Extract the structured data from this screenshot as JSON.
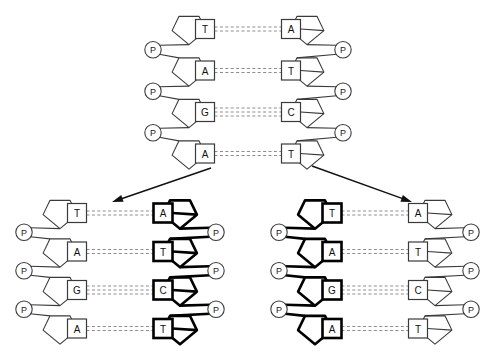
{
  "figure": {
    "background_color": "#ffffff",
    "line_color": "#3a3a3a",
    "bold_color": "#000000",
    "hbond_color": "#8d8d8d",
    "phosphate_symbol": "P"
  },
  "molecules": {
    "parent": {
      "name": "Parent DNA molecule",
      "left_strand_style": "thin",
      "right_strand_style": "thin",
      "phosphate_count_left": 3,
      "phosphate_count_right": 3,
      "rows": [
        {
          "left_base": "T",
          "right_base": "A",
          "hbonds": 2,
          "left_bold": false,
          "right_bold": false
        },
        {
          "left_base": "A",
          "right_base": "T",
          "hbonds": 2,
          "left_bold": false,
          "right_bold": false
        },
        {
          "left_base": "G",
          "right_base": "C",
          "hbonds": 3,
          "left_bold": false,
          "right_bold": false
        },
        {
          "left_base": "A",
          "right_base": "T",
          "hbonds": 2,
          "left_bold": false,
          "right_bold": false
        }
      ]
    },
    "daughter_left": {
      "name": "Daughter DNA molecule 1",
      "left_strand_style": "thin",
      "right_strand_style": "bold",
      "phosphate_count_left": 3,
      "phosphate_count_right": 3,
      "rows": [
        {
          "left_base": "T",
          "right_base": "A",
          "hbonds": 2,
          "left_bold": false,
          "right_bold": true
        },
        {
          "left_base": "A",
          "right_base": "T",
          "hbonds": 2,
          "left_bold": false,
          "right_bold": true
        },
        {
          "left_base": "G",
          "right_base": "C",
          "hbonds": 3,
          "left_bold": false,
          "right_bold": true
        },
        {
          "left_base": "A",
          "right_base": "T",
          "hbonds": 2,
          "left_bold": false,
          "right_bold": true
        }
      ]
    },
    "daughter_right": {
      "name": "Daughter DNA molecule 2",
      "left_strand_style": "bold",
      "right_strand_style": "thin",
      "phosphate_count_left": 3,
      "phosphate_count_right": 3,
      "rows": [
        {
          "left_base": "T",
          "right_base": "A",
          "hbonds": 2,
          "left_bold": true,
          "right_bold": false
        },
        {
          "left_base": "A",
          "right_base": "T",
          "hbonds": 2,
          "left_bold": true,
          "right_bold": false
        },
        {
          "left_base": "G",
          "right_base": "C",
          "hbonds": 3,
          "left_bold": true,
          "right_bold": false
        },
        {
          "left_base": "A",
          "right_base": "T",
          "hbonds": 2,
          "left_bold": true,
          "right_bold": false
        }
      ]
    }
  },
  "arrows": [
    {
      "name": "arrow-to-daughter-left",
      "x1": 211,
      "y1": 168,
      "x2": 112,
      "y2": 202
    },
    {
      "name": "arrow-to-daughter-right",
      "x1": 312,
      "y1": 166,
      "x2": 412,
      "y2": 202
    }
  ],
  "geometry": {
    "parent": {
      "cx": 248,
      "top": 12,
      "row_gap": 41.5,
      "half_width": 103
    },
    "daughter_left": {
      "cx": 120,
      "top": 196,
      "row_gap": 38.5,
      "half_width": 104
    },
    "daughter_right": {
      "cx": 375,
      "top": 196,
      "row_gap": 38.5,
      "half_width": 104
    }
  }
}
